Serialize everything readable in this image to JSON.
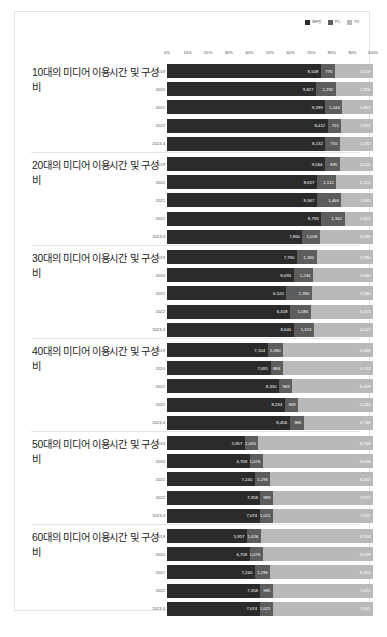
{
  "legend": [
    {
      "name": "mobile",
      "label": "모바일",
      "color": "#2b2b2b"
    },
    {
      "name": "pc",
      "label": "PC",
      "color": "#5d5d5d"
    },
    {
      "name": "tv",
      "label": "TV",
      "color": "#b9b9b9"
    }
  ],
  "axis_ticks": [
    "0%",
    "10%",
    "20%",
    "30%",
    "40%",
    "50%",
    "60%",
    "70%",
    "80%",
    "90%",
    "100%"
  ],
  "chart_data": [
    {
      "type": "bar",
      "orientation": "horizontal",
      "stacked": true,
      "normalized": true,
      "title": "10대의 미디어 이용시간 및 구성비",
      "xlabel": "",
      "ylabel": "",
      "xlim": [
        0,
        100
      ],
      "grid": true,
      "legend_position": "top-right",
      "categories": [
        "2019",
        "2020",
        "2021",
        "2022",
        "2023.4"
      ],
      "series": [
        {
          "name": "모바일",
          "values": [
            8508,
            9827,
            9599,
            8412,
            8132
          ]
        },
        {
          "name": "PC",
          "values": [
            776,
            1292,
            1044,
            715,
            755
          ]
        },
        {
          "name": "TV",
          "values": [
            2109,
            2456,
            1862,
            1655,
            1692
          ]
        }
      ],
      "labels": [
        [
          "8,508",
          "776",
          "2,109"
        ],
        [
          "9,827",
          "1,292",
          "2,456"
        ],
        [
          "9,599",
          "1,044",
          "1,862"
        ],
        [
          "8,412",
          "715",
          "1,655"
        ],
        [
          "8,132",
          "755",
          "1,692"
        ]
      ]
    },
    {
      "type": "bar",
      "orientation": "horizontal",
      "stacked": true,
      "normalized": true,
      "title": "20대의 미디어 이용시간 및 구성비",
      "xlabel": "",
      "ylabel": "",
      "xlim": [
        0,
        100
      ],
      "grid": true,
      "legend_position": "top-right",
      "categories": [
        "2019",
        "2020",
        "2021",
        "2022",
        "2023.4"
      ],
      "series": [
        {
          "name": "모바일",
          "values": [
            9564,
            8657,
            8947,
            8793,
            7860
          ]
        },
        {
          "name": "PC",
          "values": [
            895,
            1112,
            1466,
            1341,
            1008
          ]
        },
        {
          "name": "TV",
          "values": [
            2016,
            2122,
            1885,
            1622,
            3088
          ]
        }
      ],
      "labels": [
        [
          "9,564",
          "895",
          "2,016"
        ],
        [
          "8,657",
          "1,112",
          "2,122"
        ],
        [
          "8,947",
          "1,466",
          "1,885"
        ],
        [
          "8,793",
          "1,341",
          "1,622"
        ],
        [
          "7,860",
          "1,008",
          "3,088"
        ]
      ]
    },
    {
      "type": "bar",
      "orientation": "horizontal",
      "stacked": true,
      "normalized": true,
      "title": "30대의 미디어 이용시간 및 구성비",
      "xlabel": "",
      "ylabel": "",
      "xlim": [
        0,
        100
      ],
      "grid": true,
      "legend_position": "top-right",
      "categories": [
        "2019",
        "2020",
        "2021",
        "2022",
        "2023.4"
      ],
      "series": [
        {
          "name": "모바일",
          "values": [
            7790,
            8093,
            6520,
            6418,
            8640
          ]
        },
        {
          "name": "PC",
          "values": [
            1182,
            1244,
            1390,
            1083,
            1374
          ]
        },
        {
          "name": "TV",
          "values": [
            3380,
            3840,
            3340,
            3251,
            4027
          ]
        }
      ],
      "labels": [
        [
          "7,790",
          "1,182",
          "3,380"
        ],
        [
          "8,093",
          "1,244",
          "3,840"
        ],
        [
          "6,520",
          "1,390",
          "3,340"
        ],
        [
          "6,418",
          "1,083",
          "3,251"
        ],
        [
          "8,640",
          "1,374",
          "4,027"
        ]
      ]
    },
    {
      "type": "bar",
      "orientation": "horizontal",
      "stacked": true,
      "normalized": true,
      "title": "40대의 미디어 이용시간 및 구성비",
      "xlabel": "",
      "ylabel": "",
      "xlim": [
        0,
        100
      ],
      "grid": true,
      "legend_position": "top-right",
      "categories": [
        "2019",
        "2020",
        "2021",
        "2022",
        "2023.4"
      ],
      "series": [
        {
          "name": "모바일",
          "values": [
            7104,
            7691,
            8330,
            8234,
            8456
          ]
        },
        {
          "name": "PC",
          "values": [
            1090,
            884,
            969,
            939,
            986
          ]
        },
        {
          "name": "TV",
          "values": [
            6348,
            6711,
            6009,
            5243,
            4768
          ]
        }
      ],
      "labels": [
        [
          "7,104",
          "1,090",
          "6,348"
        ],
        [
          "7,691",
          "884",
          "6,711"
        ],
        [
          "8,330",
          "969",
          "6,009"
        ],
        [
          "8,234",
          "939",
          "5,243"
        ],
        [
          "8,456",
          "986",
          "4,768"
        ]
      ]
    },
    {
      "type": "bar",
      "orientation": "horizontal",
      "stacked": true,
      "normalized": true,
      "title": "50대의 미디어 이용시간 및 구성비",
      "xlabel": "",
      "ylabel": "",
      "xlim": [
        0,
        100
      ],
      "grid": true,
      "legend_position": "top-right",
      "categories": [
        "2019",
        "2020",
        "2021",
        "2022",
        "2023.4"
      ],
      "series": [
        {
          "name": "모바일",
          "values": [
            5957,
            6758,
            7240,
            7358,
            7074
          ]
        },
        {
          "name": "PC",
          "values": [
            1026,
            1076,
            1296,
            983,
            1021
          ]
        },
        {
          "name": "TV",
          "values": [
            8768,
            9009,
            8453,
            7873,
            7631
          ]
        }
      ],
      "labels": [
        [
          "5,957",
          "1,026",
          "8,768"
        ],
        [
          "6,758",
          "1,076",
          "9,009"
        ],
        [
          "7,240",
          "1,296",
          "8,453"
        ],
        [
          "7,358",
          "983",
          "7,873"
        ],
        [
          "7,074",
          "1,021",
          "7,631"
        ]
      ]
    },
    {
      "type": "bar",
      "orientation": "horizontal",
      "stacked": true,
      "normalized": true,
      "title": "60대의 미디어 이용시간 및 구성비",
      "xlabel": "",
      "ylabel": "",
      "xlim": [
        0,
        100
      ],
      "grid": true,
      "legend_position": "top-right",
      "categories": [
        "2019",
        "2020",
        "2021",
        "2022",
        "2023.4"
      ],
      "series": [
        {
          "name": "모바일",
          "values": [
            5957,
            6758,
            7240,
            7358,
            7074
          ]
        },
        {
          "name": "PC",
          "values": [
            1026,
            1076,
            1296,
            983,
            1021
          ]
        },
        {
          "name": "TV",
          "values": [
            8358,
            9009,
            8453,
            7873,
            7631
          ]
        }
      ],
      "labels": [
        [
          "5,957",
          "1,026",
          "8,358"
        ],
        [
          "6,758",
          "1,076",
          "9,009"
        ],
        [
          "7,240",
          "1,296",
          "8,453"
        ],
        [
          "7,358",
          "985",
          "7,873"
        ],
        [
          "7,074",
          "1,021",
          "7,631"
        ]
      ]
    }
  ]
}
